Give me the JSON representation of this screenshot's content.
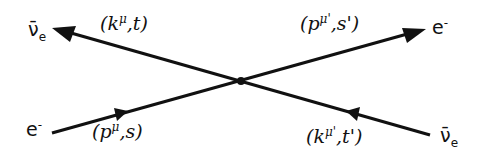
{
  "diagram": {
    "particles": {
      "top_left": {
        "symbol": "ν̄",
        "sub": "e"
      },
      "top_right": {
        "symbol": "e",
        "sup": "-"
      },
      "bottom_left": {
        "symbol": "e",
        "sup": "-"
      },
      "bottom_right": {
        "symbol": "ν̄",
        "sub": "e"
      }
    },
    "momenta": {
      "top_left": {
        "open": "(k",
        "sup": "μ",
        "rest": ",t)"
      },
      "top_right": {
        "open": "(p",
        "sup": "μ'",
        "rest": ",s')"
      },
      "bottom_left": {
        "open": "(p",
        "sup": "μ",
        "rest": ",s)"
      },
      "bottom_right": {
        "open": "(k",
        "sup": "μ'",
        "rest": ",t')"
      }
    }
  }
}
